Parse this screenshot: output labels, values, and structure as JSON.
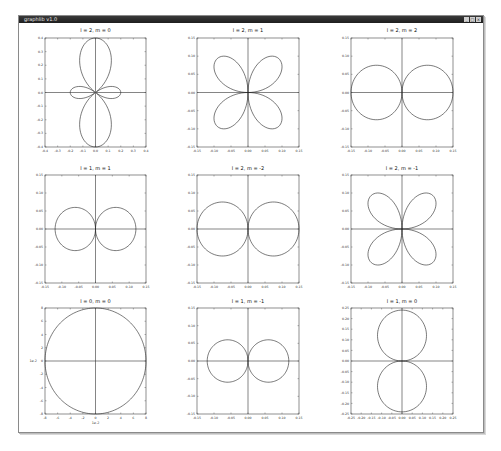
{
  "window": {
    "title": "graphlib v1.0",
    "buttons": [
      {
        "name": "minimize",
        "glyph": "_"
      },
      {
        "name": "maximize",
        "glyph": "□"
      },
      {
        "name": "close",
        "glyph": "×"
      }
    ]
  },
  "colors": {
    "titlebar": "#2a2a2a",
    "curve": "#222222",
    "axis": "#333333",
    "frame": "#444444",
    "tick_text": "#333333"
  },
  "chart_data": [
    {
      "type": "line",
      "title": "l = 2,  m = 0",
      "subtitle": "polar plot of spherical harmonic",
      "shape": "dz2",
      "xlim": [
        -0.4,
        0.4
      ],
      "ylim": [
        -0.4,
        0.4
      ],
      "xticks": [
        "-0.4",
        "-0.3",
        "-0.2",
        "-0.1",
        "0.0",
        "0.1",
        "0.2",
        "0.3",
        "0.4"
      ],
      "yticks": [
        "0.4",
        "0.3",
        "0.2",
        "0.1",
        "0.0",
        "-0.1",
        "-0.2",
        "-0.3",
        "-0.4"
      ],
      "xlabel": "",
      "ylabel": "",
      "grid": false,
      "lobe_extent": 0.4
    },
    {
      "type": "line",
      "title": "l = 2,  m = 1",
      "shape": "clover",
      "xlim": [
        -0.15,
        0.15
      ],
      "ylim": [
        -0.15,
        0.15
      ],
      "xticks": [
        "-0.15",
        "-0.10",
        "-0.05",
        "0.00",
        "0.05",
        "0.10",
        "0.15"
      ],
      "yticks": [
        "0.15",
        "0.10",
        "0.05",
        "0.00",
        "-0.05",
        "-0.10",
        "-0.15"
      ],
      "xlabel": "",
      "ylabel": "",
      "grid": false,
      "lobe_extent": 0.13
    },
    {
      "type": "line",
      "title": "l = 2,  m = 2",
      "shape": "horizontal-p",
      "xlim": [
        -0.15,
        0.15
      ],
      "ylim": [
        -0.15,
        0.15
      ],
      "xticks": [
        "-0.15",
        "-0.10",
        "-0.05",
        "0.00",
        "0.05",
        "0.10",
        "0.15"
      ],
      "yticks": [
        "0.15",
        "0.10",
        "0.05",
        "0.00",
        "-0.05",
        "-0.10",
        "-0.15"
      ],
      "xlabel": "",
      "ylabel": "",
      "grid": false,
      "lobe_extent": 0.15
    },
    {
      "type": "line",
      "title": "l = 1,  m = 1",
      "shape": "horizontal-p",
      "xlim": [
        -0.15,
        0.15
      ],
      "ylim": [
        -0.15,
        0.15
      ],
      "xticks": [
        "-0.15",
        "-0.10",
        "-0.05",
        "0.00",
        "0.05",
        "0.10",
        "0.15"
      ],
      "yticks": [
        "0.15",
        "0.10",
        "0.05",
        "0.00",
        "-0.05",
        "-0.10",
        "-0.15"
      ],
      "xlabel": "",
      "ylabel": "",
      "grid": false,
      "lobe_extent": 0.12
    },
    {
      "type": "line",
      "title": "l = 2,  m = -2",
      "shape": "horizontal-p",
      "xlim": [
        -0.15,
        0.15
      ],
      "ylim": [
        -0.15,
        0.15
      ],
      "xticks": [
        "-0.15",
        "-0.10",
        "-0.05",
        "0.00",
        "0.05",
        "0.10",
        "0.15"
      ],
      "yticks": [
        "0.15",
        "0.10",
        "0.05",
        "0.00",
        "-0.05",
        "-0.10",
        "-0.15"
      ],
      "xlabel": "",
      "ylabel": "",
      "grid": false,
      "lobe_extent": 0.15
    },
    {
      "type": "line",
      "title": "l = 2,  m = -1",
      "shape": "clover",
      "xlim": [
        -0.15,
        0.15
      ],
      "ylim": [
        -0.15,
        0.15
      ],
      "xticks": [
        "-0.15",
        "-0.10",
        "-0.05",
        "0.00",
        "0.05",
        "0.10",
        "0.15"
      ],
      "yticks": [
        "0.15",
        "0.10",
        "0.05",
        "0.00",
        "-0.05",
        "-0.10",
        "-0.15"
      ],
      "xlabel": "",
      "ylabel": "",
      "grid": false,
      "lobe_extent": 0.13
    },
    {
      "type": "line",
      "title": "l = 0,  m = 0",
      "shape": "circle",
      "xlim": [
        -8,
        8
      ],
      "ylim": [
        -8,
        8
      ],
      "xticks": [
        "-8",
        "-6",
        "-4",
        "-2",
        "0",
        "2",
        "4",
        "6",
        "8"
      ],
      "yticks": [
        "8",
        "6",
        "4",
        "2",
        "0",
        "-2",
        "-4",
        "-6",
        "-8"
      ],
      "xlabel": "1e-2",
      "ylabel": "1e-2",
      "grid": false,
      "lobe_extent": 8
    },
    {
      "type": "line",
      "title": "l = 1,  m = -1",
      "shape": "horizontal-p",
      "xlim": [
        -0.15,
        0.15
      ],
      "ylim": [
        -0.15,
        0.15
      ],
      "xticks": [
        "-0.15",
        "-0.10",
        "-0.05",
        "0.00",
        "0.05",
        "0.10",
        "0.15"
      ],
      "yticks": [
        "0.15",
        "0.10",
        "0.05",
        "0.00",
        "-0.05",
        "-0.10",
        "-0.15"
      ],
      "xlabel": "",
      "ylabel": "",
      "grid": false,
      "lobe_extent": 0.12
    },
    {
      "type": "line",
      "title": "l = 1,  m = 0",
      "shape": "vertical-p",
      "xlim": [
        -0.25,
        0.25
      ],
      "ylim": [
        -0.25,
        0.25
      ],
      "xticks": [
        "-0.25",
        "-0.20",
        "-0.15",
        "-0.10",
        "-0.05",
        "0.00",
        "0.05",
        "0.10",
        "0.15",
        "0.20",
        "0.25"
      ],
      "yticks": [
        "0.25",
        "0.20",
        "0.15",
        "0.10",
        "0.05",
        "0.00",
        "-0.05",
        "-0.10",
        "-0.15",
        "-0.20",
        "-0.25"
      ],
      "xlabel": "",
      "ylabel": "",
      "grid": false,
      "lobe_extent": 0.24
    }
  ]
}
